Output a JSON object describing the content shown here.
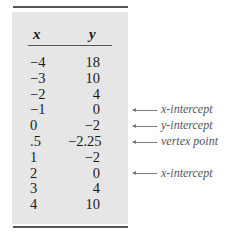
{
  "table": {
    "headers": {
      "x": "x",
      "y": "y"
    },
    "rows": [
      {
        "x": "−4",
        "y": "18",
        "note": ""
      },
      {
        "x": "−3",
        "y": "10",
        "note": ""
      },
      {
        "x": "−2",
        "y": "4",
        "note": ""
      },
      {
        "x": "−1",
        "y": "0",
        "note": "x-intercept"
      },
      {
        "x": "0",
        "y": "−2",
        "note": "y-intercept"
      },
      {
        "x": ".5",
        "y": "−2.25",
        "note": "vertex point"
      },
      {
        "x": "1",
        "y": "−2",
        "note": ""
      },
      {
        "x": "2",
        "y": "0",
        "note": "x-intercept"
      },
      {
        "x": "3",
        "y": "4",
        "note": ""
      },
      {
        "x": "4",
        "y": "10",
        "note": ""
      }
    ]
  },
  "colors": {
    "panel": "#e6e6e6",
    "rule": "#555555",
    "annotation": "#555555"
  }
}
